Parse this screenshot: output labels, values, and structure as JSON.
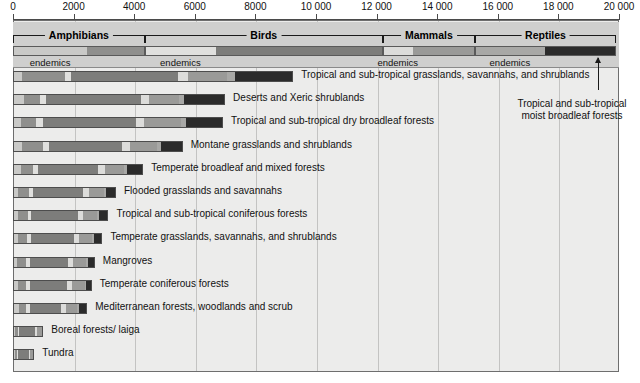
{
  "chart_data": {
    "type": "bar",
    "title": "",
    "xlabel": "",
    "ylabel": "",
    "orientation": "horizontal",
    "stacked": true,
    "grid": true,
    "xlim": [
      0,
      20000
    ],
    "xticks": [
      0,
      2000,
      4000,
      6000,
      8000,
      10000,
      12000,
      14000,
      16000,
      18000,
      20000
    ],
    "xticklabels": [
      "0",
      "2000",
      "4000",
      "6000",
      "8000",
      "10 000",
      "12 000",
      "14 000",
      "16 000",
      "18 000",
      "20 000"
    ],
    "taxa_groups": [
      {
        "name": "Amphibians",
        "start": 0,
        "end": 4350,
        "endemics_end": 2450,
        "color_endemics": "#c9c9c7",
        "color_total": "#8f8f8d"
      },
      {
        "name": "Birds",
        "start": 4350,
        "end": 12200,
        "endemics_end": 6700,
        "color_endemics": "#e0e0de",
        "color_total": "#7d7d7b"
      },
      {
        "name": "Mammals",
        "start": 12200,
        "end": 15250,
        "endemics_end": 13200,
        "color_endemics": "#dcdcda",
        "color_total": "#9a9a98"
      },
      {
        "name": "Reptiles",
        "start": 15250,
        "end": 19900,
        "endemics_end": 17550,
        "color_endemics": "#a8a8a6",
        "color_total": "#2b2b2b"
      }
    ],
    "endemics_label": "endemics",
    "series": [
      {
        "name": "Amphibians endemics",
        "color": "#c9c9c7"
      },
      {
        "name": "Amphibians total",
        "color": "#8f8f8d"
      },
      {
        "name": "Birds endemics",
        "color": "#e0e0de"
      },
      {
        "name": "Birds total",
        "color": "#7d7d7b"
      },
      {
        "name": "Mammals endemics",
        "color": "#dcdcda"
      },
      {
        "name": "Mammals total",
        "color": "#9a9a98"
      },
      {
        "name": "Reptiles endemics",
        "color": "#a8a8a6"
      },
      {
        "name": "Reptiles total",
        "color": "#2b2b2b"
      }
    ],
    "categories": [
      "Tropical and sub-tropical grasslands, savannahs, and shrublands",
      "Deserts and Xeric shrublands",
      "Tropical and sub-tropical dry broadleaf forests",
      "Montane grasslands and shrublands",
      "Temperate broadleaf and mixed forests",
      "Flooded grasslands and savannahs",
      "Tropical and sub-tropical coniferous forests",
      "Temperate grasslands, savannahs, and shrublands",
      "Mangroves",
      "Temperate coniferous forests",
      "Mediterranean forests, woodlands and scrub",
      "Boreal forests/ laiga",
      "Tundra"
    ],
    "rows": [
      {
        "label": "Tropical and sub-tropical grasslands, savannahs, and shrublands",
        "total": 7950,
        "segments": [
          {
            "series": "Amphibians endemics",
            "value": 270,
            "color": "#c9c9c7"
          },
          {
            "series": "Amphibians total",
            "value": 1430,
            "color": "#8f8f8d"
          },
          {
            "series": "Birds endemics",
            "value": 200,
            "color": "#e0e0de"
          },
          {
            "series": "Birds total",
            "value": 3550,
            "color": "#7d7d7b"
          },
          {
            "series": "Mammals endemics",
            "value": 330,
            "color": "#dcdcda"
          },
          {
            "series": "Mammals total",
            "value": 1300,
            "color": "#9a9a98"
          },
          {
            "series": "Reptiles endemics",
            "value": 270,
            "color": "#a8a8a6"
          },
          {
            "series": "Reptiles total",
            "value": 1900,
            "color": "#2b2b2b"
          }
        ]
      },
      {
        "label": "Deserts and Xeric shrublands",
        "total": 7000,
        "segments": [
          {
            "series": "Amphibians endemics",
            "value": 330,
            "color": "#c9c9c7"
          },
          {
            "series": "Amphibians total",
            "value": 530,
            "color": "#8f8f8d"
          },
          {
            "series": "Birds endemics",
            "value": 200,
            "color": "#e0e0de"
          },
          {
            "series": "Birds total",
            "value": 3170,
            "color": "#7d7d7b"
          },
          {
            "series": "Mammals endemics",
            "value": 270,
            "color": "#dcdcda"
          },
          {
            "series": "Mammals total",
            "value": 1000,
            "color": "#9a9a98"
          },
          {
            "series": "Reptiles endemics",
            "value": 170,
            "color": "#a8a8a6"
          },
          {
            "series": "Reptiles total",
            "value": 1330,
            "color": "#2b2b2b"
          }
        ]
      },
      {
        "label": "Tropical and sub-tropical dry broadleaf forests",
        "total": 6930,
        "segments": [
          {
            "series": "Amphibians endemics",
            "value": 230,
            "color": "#c9c9c7"
          },
          {
            "series": "Amphibians total",
            "value": 500,
            "color": "#8f8f8d"
          },
          {
            "series": "Birds endemics",
            "value": 230,
            "color": "#e0e0de"
          },
          {
            "series": "Birds total",
            "value": 3100,
            "color": "#7d7d7b"
          },
          {
            "series": "Mammals endemics",
            "value": 270,
            "color": "#dcdcda"
          },
          {
            "series": "Mammals total",
            "value": 1230,
            "color": "#9a9a98"
          },
          {
            "series": "Reptiles endemics",
            "value": 170,
            "color": "#a8a8a6"
          },
          {
            "series": "Reptiles total",
            "value": 1200,
            "color": "#2b2b2b"
          }
        ]
      },
      {
        "label": "Montane grasslands and shrublands",
        "total": 5600,
        "segments": [
          {
            "series": "Amphibians endemics",
            "value": 270,
            "color": "#c9c9c7"
          },
          {
            "series": "Amphibians total",
            "value": 700,
            "color": "#8f8f8d"
          },
          {
            "series": "Birds endemics",
            "value": 200,
            "color": "#e0e0de"
          },
          {
            "series": "Birds total",
            "value": 2430,
            "color": "#7d7d7b"
          },
          {
            "series": "Mammals endemics",
            "value": 270,
            "color": "#dcdcda"
          },
          {
            "series": "Mammals total",
            "value": 900,
            "color": "#9a9a98"
          },
          {
            "series": "Reptiles endemics",
            "value": 130,
            "color": "#a8a8a6"
          },
          {
            "series": "Reptiles total",
            "value": 700,
            "color": "#2b2b2b"
          }
        ]
      },
      {
        "label": "Temperate broadleaf and mixed forests",
        "total": 4300,
        "segments": [
          {
            "series": "Amphibians endemics",
            "value": 230,
            "color": "#c9c9c7"
          },
          {
            "series": "Amphibians total",
            "value": 400,
            "color": "#8f8f8d"
          },
          {
            "series": "Birds endemics",
            "value": 170,
            "color": "#e0e0de"
          },
          {
            "series": "Birds total",
            "value": 2030,
            "color": "#7d7d7b"
          },
          {
            "series": "Mammals endemics",
            "value": 230,
            "color": "#dcdcda"
          },
          {
            "series": "Mammals total",
            "value": 640,
            "color": "#9a9a98"
          },
          {
            "series": "Reptiles endemics",
            "value": 100,
            "color": "#a8a8a6"
          },
          {
            "series": "Reptiles total",
            "value": 500,
            "color": "#2b2b2b"
          }
        ]
      },
      {
        "label": "Flooded grasslands and savannahs",
        "total": 3400,
        "segments": [
          {
            "series": "Amphibians endemics",
            "value": 130,
            "color": "#c9c9c7"
          },
          {
            "series": "Amphibians total",
            "value": 370,
            "color": "#8f8f8d"
          },
          {
            "series": "Birds endemics",
            "value": 130,
            "color": "#e0e0de"
          },
          {
            "series": "Birds total",
            "value": 1700,
            "color": "#7d7d7b"
          },
          {
            "series": "Mammals endemics",
            "value": 200,
            "color": "#dcdcda"
          },
          {
            "series": "Mammals total",
            "value": 500,
            "color": "#9a9a98"
          },
          {
            "series": "Reptiles endemics",
            "value": 70,
            "color": "#a8a8a6"
          },
          {
            "series": "Reptiles total",
            "value": 300,
            "color": "#2b2b2b"
          }
        ]
      },
      {
        "label": "Tropical and sub-tropical coniferous forests",
        "total": 3150,
        "segments": [
          {
            "series": "Amphibians endemics",
            "value": 130,
            "color": "#c9c9c7"
          },
          {
            "series": "Amphibians total",
            "value": 330,
            "color": "#8f8f8d"
          },
          {
            "series": "Birds endemics",
            "value": 130,
            "color": "#e0e0de"
          },
          {
            "series": "Birds total",
            "value": 1570,
            "color": "#7d7d7b"
          },
          {
            "series": "Mammals endemics",
            "value": 170,
            "color": "#dcdcda"
          },
          {
            "series": "Mammals total",
            "value": 470,
            "color": "#9a9a98"
          },
          {
            "series": "Reptiles endemics",
            "value": 70,
            "color": "#a8a8a6"
          },
          {
            "series": "Reptiles total",
            "value": 280,
            "color": "#2b2b2b"
          }
        ]
      },
      {
        "label": "Temperate grasslands, savannahs, and shrublands",
        "total": 2950,
        "segments": [
          {
            "series": "Amphibians endemics",
            "value": 130,
            "color": "#c9c9c7"
          },
          {
            "series": "Amphibians total",
            "value": 300,
            "color": "#8f8f8d"
          },
          {
            "series": "Birds endemics",
            "value": 130,
            "color": "#e0e0de"
          },
          {
            "series": "Birds total",
            "value": 1470,
            "color": "#7d7d7b"
          },
          {
            "series": "Mammals endemics",
            "value": 170,
            "color": "#dcdcda"
          },
          {
            "series": "Mammals total",
            "value": 430,
            "color": "#9a9a98"
          },
          {
            "series": "Reptiles endemics",
            "value": 70,
            "color": "#a8a8a6"
          },
          {
            "series": "Reptiles total",
            "value": 250,
            "color": "#2b2b2b"
          }
        ]
      },
      {
        "label": "Mangroves",
        "total": 2700,
        "segments": [
          {
            "series": "Amphibians endemics",
            "value": 100,
            "color": "#c9c9c7"
          },
          {
            "series": "Amphibians total",
            "value": 300,
            "color": "#8f8f8d"
          },
          {
            "series": "Birds endemics",
            "value": 130,
            "color": "#e0e0de"
          },
          {
            "series": "Birds total",
            "value": 1300,
            "color": "#7d7d7b"
          },
          {
            "series": "Mammals endemics",
            "value": 170,
            "color": "#dcdcda"
          },
          {
            "series": "Mammals total",
            "value": 430,
            "color": "#9a9a98"
          },
          {
            "series": "Reptiles endemics",
            "value": 70,
            "color": "#a8a8a6"
          },
          {
            "series": "Reptiles total",
            "value": 200,
            "color": "#2b2b2b"
          }
        ]
      },
      {
        "label": "Temperate coniferous forests",
        "total": 2600,
        "segments": [
          {
            "series": "Amphibians endemics",
            "value": 130,
            "color": "#c9c9c7"
          },
          {
            "series": "Amphibians total",
            "value": 270,
            "color": "#8f8f8d"
          },
          {
            "series": "Birds endemics",
            "value": 130,
            "color": "#e0e0de"
          },
          {
            "series": "Birds total",
            "value": 1270,
            "color": "#7d7d7b"
          },
          {
            "series": "Mammals endemics",
            "value": 170,
            "color": "#dcdcda"
          },
          {
            "series": "Mammals total",
            "value": 430,
            "color": "#9a9a98"
          },
          {
            "series": "Reptiles endemics",
            "value": 50,
            "color": "#a8a8a6"
          },
          {
            "series": "Reptiles total",
            "value": 150,
            "color": "#2b2b2b"
          }
        ]
      },
      {
        "label": "Mediterranean forests, woodlands and scrub",
        "total": 2450,
        "segments": [
          {
            "series": "Amphibians endemics",
            "value": 170,
            "color": "#c9c9c7"
          },
          {
            "series": "Amphibians total",
            "value": 230,
            "color": "#8f8f8d"
          },
          {
            "series": "Birds endemics",
            "value": 130,
            "color": "#e0e0de"
          },
          {
            "series": "Birds total",
            "value": 1070,
            "color": "#7d7d7b"
          },
          {
            "series": "Mammals endemics",
            "value": 170,
            "color": "#dcdcda"
          },
          {
            "series": "Mammals total",
            "value": 380,
            "color": "#9a9a98"
          },
          {
            "series": "Reptiles endemics",
            "value": 50,
            "color": "#a8a8a6"
          },
          {
            "series": "Reptiles total",
            "value": 250,
            "color": "#2b2b2b"
          }
        ]
      },
      {
        "label": "Boreal forests/ laiga",
        "total": 1000,
        "segments": [
          {
            "series": "Amphibians endemics",
            "value": 30,
            "color": "#c9c9c7"
          },
          {
            "series": "Amphibians total",
            "value": 100,
            "color": "#8f8f8d"
          },
          {
            "series": "Birds endemics",
            "value": 30,
            "color": "#e0e0de"
          },
          {
            "series": "Birds total",
            "value": 570,
            "color": "#7d7d7b"
          },
          {
            "series": "Mammals endemics",
            "value": 70,
            "color": "#dcdcda"
          },
          {
            "series": "Mammals total",
            "value": 200,
            "color": "#9a9a98"
          }
        ]
      },
      {
        "label": "Tundra",
        "total": 700,
        "segments": [
          {
            "series": "Amphibians endemics",
            "value": 30,
            "color": "#c9c9c7"
          },
          {
            "series": "Amphibians total",
            "value": 70,
            "color": "#8f8f8d"
          },
          {
            "series": "Birds endemics",
            "value": 30,
            "color": "#e0e0de"
          },
          {
            "series": "Birds total",
            "value": 400,
            "color": "#7d7d7b"
          },
          {
            "series": "Mammals endemics",
            "value": 50,
            "color": "#dcdcda"
          },
          {
            "series": "Mammals total",
            "value": 120,
            "color": "#9a9a98"
          }
        ]
      }
    ],
    "annotations": [
      {
        "text": "Tropical and sub-tropical moist broadleaf forests",
        "line1": "Tropical and sub-tropical",
        "line2": "moist broadleaf forests",
        "points_to": "Reptiles dark segment of top legend bar"
      }
    ]
  },
  "colors": {
    "plot_background": "#ececeb",
    "legend_background": "#cfcfce",
    "gridline": "#c3c3c2",
    "frame": "#6e6e6e",
    "text": "#111111"
  }
}
